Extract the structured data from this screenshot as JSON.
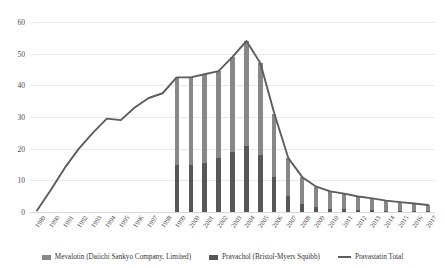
{
  "chart_data": {
    "type": "bar",
    "title": "",
    "subtitle": "",
    "xlabel": "",
    "ylabel": "",
    "grid": true,
    "legend_position": "bottom",
    "ylim": [
      0,
      60
    ],
    "yticks": [
      0,
      10,
      20,
      30,
      40,
      50,
      60
    ],
    "categories": [
      "1989",
      "1990",
      "1991",
      "1992",
      "1993",
      "1994",
      "1995",
      "1996",
      "1997",
      "1998",
      "1999",
      "2000",
      "2001",
      "2002",
      "2003",
      "2004",
      "2005",
      "2006",
      "2007",
      "2008",
      "2009",
      "2010",
      "2011",
      "2012",
      "2013",
      "2014",
      "2015",
      "2016",
      "2017"
    ],
    "series": [
      {
        "name": "Mevalotin (Daiichi Sankyo Company, Limited)",
        "chart_type": "bar",
        "stack": "sales",
        "color": "#888888",
        "values": [
          null,
          null,
          null,
          null,
          null,
          null,
          null,
          null,
          null,
          null,
          27.5,
          27.5,
          28.0,
          27.5,
          30.0,
          33.0,
          29.0,
          20.0,
          12.0,
          8.5,
          6.5,
          5.5,
          5.0,
          4.3,
          3.8,
          3.2,
          2.8,
          2.4,
          2.0
        ]
      },
      {
        "name": "Pravachol (Bristol-Myers Squibb)",
        "chart_type": "bar",
        "stack": "sales",
        "color": "#575757",
        "values": [
          null,
          null,
          null,
          null,
          null,
          null,
          null,
          null,
          null,
          null,
          15.0,
          15.0,
          15.5,
          17.0,
          19.0,
          21.0,
          18.0,
          11.0,
          5.0,
          2.5,
          1.5,
          1.0,
          0.8,
          0.6,
          0.5,
          0.4,
          0.3,
          0.3,
          0.2
        ]
      },
      {
        "name": "Pravastatin Total",
        "chart_type": "line",
        "color": "#5d5d5d",
        "values": [
          0.5,
          7.0,
          14.0,
          20.0,
          25.0,
          29.5,
          29.0,
          33.0,
          36.0,
          37.5,
          42.5,
          42.5,
          43.5,
          44.5,
          49.0,
          54.0,
          47.0,
          31.0,
          17.0,
          11.0,
          8.0,
          6.5,
          5.8,
          4.9,
          4.3,
          3.6,
          3.1,
          2.7,
          2.2
        ]
      }
    ],
    "legend": [
      {
        "label": "Mevalotin (Daiichi Sankyo Company, Limited)",
        "marker": "bar",
        "color": "#888888"
      },
      {
        "label": "Pravachol (Bristol-Myers Squibb)",
        "marker": "bar",
        "color": "#575757"
      },
      {
        "label": "Pravastatin Total",
        "marker": "line",
        "color": "#5d5d5d"
      }
    ]
  }
}
